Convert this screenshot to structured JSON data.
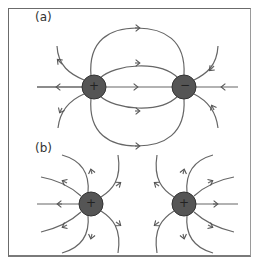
{
  "panels": [
    {
      "label": "(a)",
      "description": "Field lines between positive and negative charge",
      "charges": [
        {
          "sign": "+",
          "symbol": "+"
        },
        {
          "sign": "-",
          "symbol": "−"
        }
      ]
    },
    {
      "label": "(b)",
      "description": "Field lines between two positive charges",
      "charges": [
        {
          "sign": "+",
          "symbol": "+"
        },
        {
          "sign": "+",
          "symbol": "+"
        }
      ]
    }
  ],
  "colors": {
    "line": "#555555",
    "charge_fill": "#555555",
    "charge_stroke": "#333333",
    "frame": "#6b6b6b"
  }
}
